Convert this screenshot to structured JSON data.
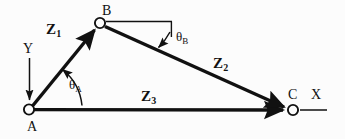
{
  "figure": {
    "type": "vector-loop-kinematic-diagram",
    "background_color": "#fcfcfc",
    "stroke_color": "#111111",
    "joints": [
      {
        "id": "A",
        "label": "A",
        "x": 29,
        "y": 109,
        "radius": 5
      },
      {
        "id": "B",
        "label": "B",
        "x": 100,
        "y": 23,
        "radius": 5
      },
      {
        "id": "C",
        "label": "C",
        "x": 293,
        "y": 110,
        "radius": 5
      }
    ],
    "vectors": [
      {
        "id": "Z1",
        "base": "Z",
        "sub": "1",
        "from": "A",
        "to": "B"
      },
      {
        "id": "Z2",
        "base": "Z",
        "sub": "2",
        "from": "B",
        "to": "C"
      },
      {
        "id": "Z3",
        "base": "Z",
        "sub": "3",
        "from": "A",
        "to": "C"
      }
    ],
    "angles": [
      {
        "id": "thetaA",
        "base": "θ",
        "sub": "A",
        "at": "A",
        "from": "Z3",
        "to": "Z1"
      },
      {
        "id": "thetaB",
        "base": "θ",
        "sub": "B",
        "at": "B",
        "from": "horizontal-reference",
        "to": "Z2"
      }
    ],
    "axes": [
      {
        "id": "X",
        "label": "X",
        "origin": "C",
        "direction": "right"
      },
      {
        "id": "Y",
        "label": "Y",
        "origin": "A",
        "direction": "up"
      }
    ],
    "reference_line": {
      "id": "b-horizontal",
      "from": "B",
      "direction": "right"
    }
  },
  "labels": {
    "point_a": "A",
    "point_b": "B",
    "point_c": "C",
    "axis_x": "X",
    "axis_y": "Y",
    "z1_base": "Z",
    "z1_sub": "1",
    "z2_base": "Z",
    "z2_sub": "2",
    "z3_base": "Z",
    "z3_sub": "3",
    "theta_a_base": "θ",
    "theta_a_sub": "A",
    "theta_b_base": "θ",
    "theta_b_sub": "B"
  }
}
